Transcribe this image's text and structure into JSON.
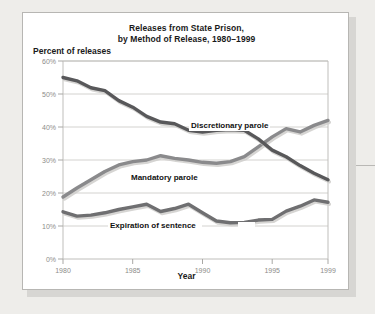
{
  "card": {
    "title_line1": "Releases from State Prison,",
    "title_line2": "by Method of Release, 1980–1999",
    "y_axis_title": "Percent of releases",
    "x_axis_title": "Year"
  },
  "axis": {
    "y_ticks": [
      "60%",
      "50%",
      "40%",
      "30%",
      "20%",
      "10%",
      "0%"
    ],
    "x_ticks": [
      "1980",
      "1985",
      "1990",
      "1995",
      "1999"
    ]
  },
  "colors": {
    "discretionary": "#58585a",
    "mandatory": "#8a8a8c",
    "expiration": "#6f6f71",
    "card_background": "#ffffff",
    "page_background": "#eeedea",
    "gridline": "#d3d2cf",
    "tick_text": "#8d8c89"
  },
  "chart_data": {
    "type": "line",
    "title": "Releases from State Prison, by Method of Release, 1980–1999",
    "xlabel": "Year",
    "ylabel": "Percent of releases",
    "xlim": [
      1980,
      1999
    ],
    "ylim": [
      0,
      60
    ],
    "ytick_values": [
      0,
      10,
      20,
      30,
      40,
      50,
      60
    ],
    "xtick_values": [
      1980,
      1985,
      1990,
      1995,
      1999
    ],
    "grid": true,
    "legend": "inline-labels",
    "x": [
      1980,
      1981,
      1982,
      1983,
      1984,
      1985,
      1986,
      1987,
      1988,
      1989,
      1990,
      1991,
      1992,
      1993,
      1994,
      1995,
      1996,
      1997,
      1998,
      1999
    ],
    "series": [
      {
        "name": "Discretionary parole",
        "label": "Discretionary parole",
        "color": "#58585a",
        "values": [
          55.0,
          54.0,
          51.9,
          51.0,
          48.0,
          46.0,
          43.2,
          41.5,
          41.0,
          39.0,
          38.5,
          39.0,
          39.2,
          39.0,
          36.4,
          33.0,
          31.0,
          28.3,
          26.0,
          24.0
        ]
      },
      {
        "name": "Mandatory parole",
        "label": "Mandatory parole",
        "color": "#8a8a8c",
        "values": [
          18.8,
          21.5,
          24.0,
          26.5,
          28.5,
          29.5,
          30.0,
          31.3,
          30.5,
          30.0,
          29.3,
          29.0,
          29.5,
          31.0,
          34.0,
          37.0,
          39.5,
          38.5,
          40.5,
          42.0
        ]
      },
      {
        "name": "Expiration of sentence",
        "label": "Expiration of sentence",
        "color": "#6f6f71",
        "values": [
          14.3,
          13.0,
          13.3,
          14.0,
          15.0,
          15.8,
          16.6,
          14.4,
          15.3,
          16.6,
          14.0,
          11.5,
          11.0,
          11.1,
          11.8,
          12.0,
          14.5,
          16.0,
          17.9,
          17.2
        ]
      }
    ]
  }
}
